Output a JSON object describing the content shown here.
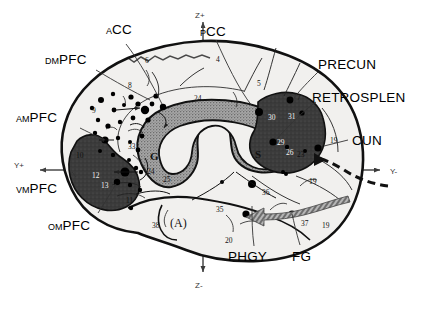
{
  "figure": {
    "type": "medial-surface-brain-diagram"
  },
  "axes": {
    "z_positive": "Z+",
    "z_negative": "Z-",
    "y_positive": "Y+",
    "y_negative": "Y-"
  },
  "labels_left": [
    {
      "prefix": "A",
      "name": "CC",
      "full": "ACC"
    },
    {
      "prefix": "DM",
      "name": "PFC",
      "full": "DMPFC"
    },
    {
      "prefix": "AM",
      "name": "PFC",
      "full": "AMPFC"
    },
    {
      "prefix": "VM",
      "name": "PFC",
      "full": "VMPFC"
    },
    {
      "prefix": "OM",
      "name": "PFC",
      "full": "OMPFC"
    }
  ],
  "labels_right": [
    {
      "prefix": "P",
      "name": "CC",
      "full": "PCC"
    },
    {
      "prefix": "",
      "name": "PRECUN",
      "full": "PRECUN"
    },
    {
      "prefix": "",
      "name": "RETROSPLEN",
      "full": "RETROSPLEN"
    },
    {
      "prefix": "",
      "name": "CUN",
      "full": "CUN"
    }
  ],
  "labels_bottom": [
    {
      "prefix": "",
      "name": "PHGY",
      "full": "PHGY"
    },
    {
      "prefix": "",
      "name": "FG",
      "full": "FG"
    }
  ],
  "brodmann_areas": [
    {
      "id": "a6",
      "text": "6",
      "x": 145,
      "y": 63
    },
    {
      "id": "a4",
      "text": "4",
      "x": 216,
      "y": 62
    },
    {
      "id": "a5",
      "text": "5",
      "x": 257,
      "y": 86
    },
    {
      "id": "a8",
      "text": "8",
      "x": 128,
      "y": 88
    },
    {
      "id": "a9",
      "text": "9",
      "x": 92,
      "y": 113
    },
    {
      "id": "a24t",
      "text": "24",
      "x": 194,
      "y": 101
    },
    {
      "id": "a7",
      "text": "7",
      "x": 297,
      "y": 100
    },
    {
      "id": "a33",
      "text": "33",
      "x": 128,
      "y": 149
    },
    {
      "id": "a10",
      "text": "10",
      "x": 76,
      "y": 158
    },
    {
      "id": "a24b",
      "text": "24",
      "x": 147,
      "y": 174
    },
    {
      "id": "a25",
      "text": "25",
      "x": 163,
      "y": 182
    },
    {
      "id": "a11",
      "text": "11",
      "x": 126,
      "y": 203
    },
    {
      "id": "a38",
      "text": "38",
      "x": 152,
      "y": 228
    },
    {
      "id": "a35",
      "text": "35",
      "x": 216,
      "y": 212
    },
    {
      "id": "a20",
      "text": "20",
      "x": 225,
      "y": 243
    },
    {
      "id": "a36",
      "text": "36",
      "x": 262,
      "y": 195
    },
    {
      "id": "a37",
      "text": "37",
      "x": 301,
      "y": 226
    },
    {
      "id": "a19a",
      "text": "19",
      "x": 309,
      "y": 184
    },
    {
      "id": "a19b",
      "text": "19",
      "x": 322,
      "y": 228
    },
    {
      "id": "a19c",
      "text": "19",
      "x": 330,
      "y": 143
    },
    {
      "id": "a23",
      "text": "23",
      "x": 297,
      "y": 157
    }
  ],
  "brodmann_areas_light": [
    {
      "id": "a30",
      "text": "30",
      "x": 268,
      "y": 120
    },
    {
      "id": "a31",
      "text": "31",
      "x": 288,
      "y": 119
    },
    {
      "id": "a29",
      "text": "29",
      "x": 277,
      "y": 145
    },
    {
      "id": "a26",
      "text": "26",
      "x": 286,
      "y": 155
    },
    {
      "id": "a12",
      "text": "12",
      "x": 92,
      "y": 178
    },
    {
      "id": "a13",
      "text": "13",
      "x": 101,
      "y": 188
    }
  ],
  "callosum": {
    "genu": "G",
    "splenium": "S"
  },
  "amygdala": {
    "label": "(A)"
  },
  "colors": {
    "outline": "#111111",
    "cortex_fill": "#f1f0ee",
    "callosum_fill": "#9a9a9a",
    "dark_region": "#3a3a3a",
    "arrow_gray": "#8d8d8d",
    "dot": "#000000",
    "axis": "#4a4a4a"
  }
}
